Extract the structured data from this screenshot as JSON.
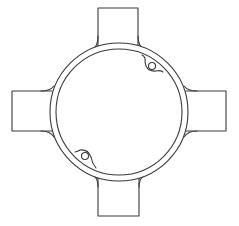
{
  "diagram": {
    "background_color": "#ffffff",
    "line_color": "#3a3a3a",
    "center": [
      119,
      112
    ],
    "outer_ring_radius": 69,
    "inner_ring_radius": 63,
    "tabs": [
      {
        "name": "top-tab",
        "x": 98,
        "y": 8,
        "width": 40,
        "height": 40
      },
      {
        "name": "right-tab",
        "x": 189,
        "y": 91,
        "width": 37,
        "height": 40
      },
      {
        "name": "bottom-tab",
        "x": 98,
        "y": 176,
        "width": 41,
        "height": 40
      },
      {
        "name": "left-tab",
        "x": 12,
        "y": 91,
        "width": 38,
        "height": 40
      }
    ],
    "screw_lugs": [
      {
        "name": "top-right-lug",
        "cx": 152,
        "cy": 67,
        "r": 3.5
      },
      {
        "name": "bottom-left-lug",
        "cx": 85,
        "cy": 156,
        "r": 3.5
      }
    ]
  }
}
